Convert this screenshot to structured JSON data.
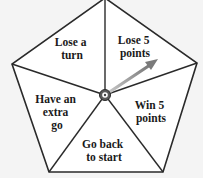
{
  "diagram": {
    "type": "spinner",
    "shape": "pentagon",
    "colors": {
      "background": "#f4f4f4",
      "fill": "#ffffff",
      "stroke": "#2a2a2a",
      "arrow": "#8a8a8a",
      "hub": "#555555"
    },
    "sectors": [
      {
        "id": "lose-a-turn",
        "lines": [
          "Lose a",
          "turn"
        ]
      },
      {
        "id": "lose-5-points",
        "lines": [
          "Lose 5",
          "points"
        ]
      },
      {
        "id": "win-5-points",
        "lines": [
          "Win 5",
          "points"
        ]
      },
      {
        "id": "go-back-to-start",
        "lines": [
          "Go back",
          "to start"
        ]
      },
      {
        "id": "have-an-extra-go",
        "lines": [
          "Have an",
          "extra",
          "go"
        ]
      }
    ],
    "pointer": {
      "points_to": "Lose 5 points"
    }
  }
}
